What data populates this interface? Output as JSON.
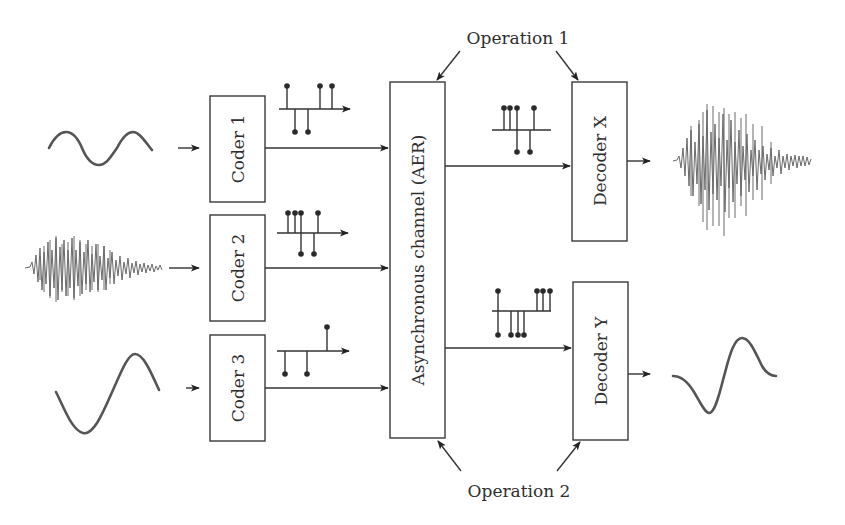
{
  "diagram": {
    "operations": {
      "top": "Operation 1",
      "bottom": "Operation 2"
    },
    "coders": [
      {
        "label": "Coder 1",
        "input_signal": "sine-wave-two-periods"
      },
      {
        "label": "Coder 2",
        "input_signal": "speech-burst"
      },
      {
        "label": "Coder 3",
        "input_signal": "sine-wave-one-period"
      }
    ],
    "channel": {
      "label": "Asynchronous channel (AER)"
    },
    "decoders": [
      {
        "label": "Decoder X",
        "output_signal": "speech-burst"
      },
      {
        "label": "Decoder Y",
        "output_signal": "single-sine-cycle"
      }
    ],
    "spike_trains": {
      "coder1": {
        "up": [
          0,
          3,
          4
        ],
        "down": [
          1,
          2
        ]
      },
      "coder2": {
        "up": [
          0,
          1,
          2,
          5
        ],
        "down": [
          3,
          4
        ]
      },
      "coder3": {
        "up": [
          4
        ],
        "down": [
          0,
          2
        ]
      },
      "decoderX": {
        "up": [
          0,
          1,
          2,
          5
        ],
        "down": [
          3,
          4
        ]
      },
      "decoderY": {
        "up": [
          0,
          6,
          7,
          8
        ],
        "down": [
          0,
          2,
          3,
          4
        ]
      }
    },
    "colors": {
      "stroke": "#333333",
      "wave": "#555555",
      "background": "#ffffff"
    }
  }
}
